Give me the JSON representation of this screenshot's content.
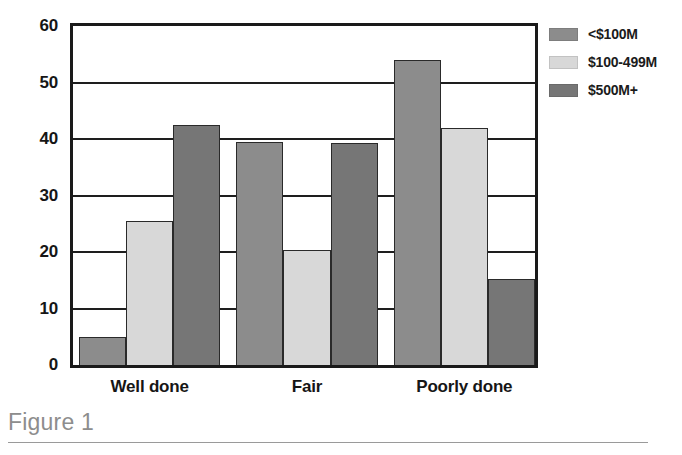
{
  "figure": {
    "caption": "Figure 1"
  },
  "chart_data": {
    "type": "bar",
    "title": "",
    "xlabel": "",
    "ylabel": "",
    "categories": [
      "Well done",
      "Fair",
      "Poorly done"
    ],
    "series": [
      {
        "name": "<$100M",
        "color": "#8c8c8c",
        "values": [
          5.0,
          39.5,
          54.0
        ]
      },
      {
        "name": "$100-499M",
        "color": "#d8d8d8",
        "values": [
          25.5,
          20.3,
          42.0
        ]
      },
      {
        "name": "$500M+",
        "color": "#767676",
        "values": [
          42.5,
          39.3,
          15.3
        ]
      }
    ],
    "yticks": [
      0,
      10,
      20,
      30,
      40,
      50,
      60
    ],
    "ylim": [
      0,
      60
    ],
    "grid": true,
    "legend_position": "right"
  },
  "legend": {
    "items": [
      {
        "label": "<$100M",
        "swatch": "#8c8c8c"
      },
      {
        "label": "$100-499M",
        "swatch": "#d8d8d8"
      },
      {
        "label": "$500M+",
        "swatch": "#767676"
      }
    ]
  }
}
